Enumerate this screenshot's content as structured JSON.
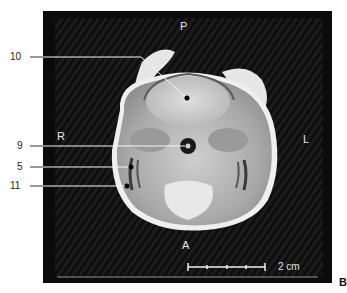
{
  "figure": {
    "panel_letter": "B",
    "orientation": {
      "top": "P",
      "bottom": "A",
      "left": "R",
      "right": "L"
    },
    "scale_bar": {
      "label": "2 cm",
      "segments": 4
    },
    "callouts": [
      {
        "id": "10",
        "label": "10"
      },
      {
        "id": "9",
        "label": "9"
      },
      {
        "id": "5",
        "label": "5"
      },
      {
        "id": "11",
        "label": "11"
      }
    ],
    "colors": {
      "frame_background": "#0b0b0b",
      "tissue_light": "#d8d8d8",
      "tissue_mid": "#a8a8a8",
      "leader_line": "#ffffff",
      "label_text": "#222222"
    }
  }
}
